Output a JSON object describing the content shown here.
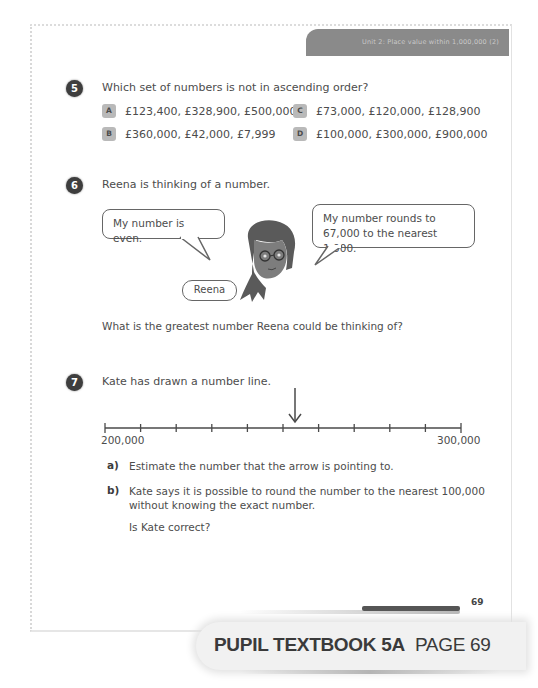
{
  "header": {
    "unit_title": "Unit 2: Place value within 1,000,000 (2)"
  },
  "questions": [
    {
      "number": "5",
      "text": "Which set of numbers is not in ascending order?",
      "options": [
        {
          "letter": "A",
          "value": "£123,400, £328,900, £500,000"
        },
        {
          "letter": "B",
          "value": "£360,000, £42,000, £7,999"
        },
        {
          "letter": "C",
          "value": "£73,000, £120,000, £128,900"
        },
        {
          "letter": "D",
          "value": "£100,000, £300,000, £900,000"
        }
      ]
    },
    {
      "number": "6",
      "text": "Reena is thinking of a number.",
      "bubble_left": "My number is even.",
      "bubble_right_line1": "My number rounds to",
      "bubble_right_line2": "67,000 to the nearest 1,000.",
      "character_name": "Reena",
      "follow_up": "What is the greatest number Reena could be thinking of?"
    },
    {
      "number": "7",
      "text": "Kate has drawn a number line.",
      "number_line": {
        "start_label": "200,000",
        "end_label": "300,000",
        "tick_count": 11,
        "arrow_position_fraction": 0.52
      },
      "parts": [
        {
          "letter": "a)",
          "lines": [
            "Estimate the number that the arrow is pointing to."
          ]
        },
        {
          "letter": "b)",
          "lines": [
            "Kate says it is possible to round the number to the nearest 100,000",
            "without knowing the exact number."
          ],
          "follow_up": "Is Kate correct?"
        }
      ]
    }
  ],
  "footer": {
    "page_number": "69",
    "banner_bold": "PUPIL TEXTBOOK 5A",
    "banner_regular": "PAGE 69"
  }
}
